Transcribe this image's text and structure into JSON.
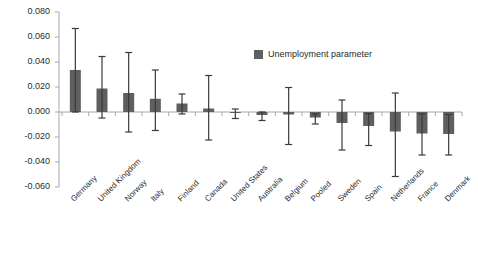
{
  "chart_data": {
    "type": "bar",
    "title": "",
    "subtitle": "",
    "xlabel": "",
    "ylabel": "",
    "grid": false,
    "legend_position": "top-right",
    "ylim": [
      -0.06,
      0.08
    ],
    "ytick_step": 0.02,
    "ytick_labels": [
      "0.080",
      "0.060",
      "0.040",
      "0.020",
      "0.000",
      "-0.020",
      "-0.040",
      "-0.060"
    ],
    "ytick_values": [
      0.08,
      0.06,
      0.04,
      0.02,
      0.0,
      -0.02,
      -0.04,
      -0.06
    ],
    "series_name": "Unemployment parameter",
    "series_color": "#5f5f5f",
    "error_bar_color": "#3a3a3a",
    "axis_color": "#a8a8a8",
    "categories": [
      "Germany",
      "United Kingdom",
      "Norway",
      "Italy",
      "Finland",
      "Canada",
      "United States",
      "Australia",
      "Belgium",
      "Pooled",
      "Sweden",
      "Spain",
      "Netherlands",
      "France",
      "Denmark"
    ],
    "values": [
      0.0336,
      0.0188,
      0.0152,
      0.0106,
      0.0068,
      0.0028,
      0.0,
      -0.0024,
      -0.002,
      -0.0044,
      -0.0088,
      -0.0112,
      -0.0156,
      -0.0172,
      -0.0176
    ],
    "error_upper": [
      0.0668,
      0.0444,
      0.0476,
      0.0336,
      0.0144,
      0.0292,
      0.0024,
      0.0,
      0.0196,
      -0.0016,
      0.0096,
      -0.0012,
      0.0152,
      -0.0016,
      -0.002
    ],
    "error_lower": [
      0.0,
      -0.0048,
      -0.016,
      -0.0148,
      -0.0016,
      -0.0224,
      -0.0052,
      -0.0068,
      -0.026,
      -0.0096,
      -0.0304,
      -0.0268,
      -0.0516,
      -0.0344,
      -0.0344
    ]
  },
  "legend": {
    "label": "Unemployment parameter"
  }
}
